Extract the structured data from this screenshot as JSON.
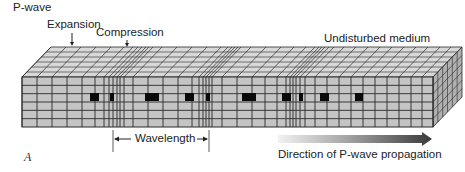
{
  "figure": {
    "title": "P-wave",
    "panel_label": "A",
    "labels": {
      "expansion": "Expansion",
      "compression": "Compression",
      "undisturbed": "Undisturbed medium",
      "wavelength": "Wavelength",
      "direction": "Direction of P-wave propagation"
    },
    "colors": {
      "block_face": "#c4c4c4",
      "top_face": "#d8d8d8",
      "side_face": "#b0b0b0",
      "grid_line": "#2a2a2a",
      "particle": "#0a0a0a",
      "arrow_start": "#f2f2f2",
      "arrow_end": "#3a3a3a",
      "text": "#222222"
    },
    "block": {
      "front": {
        "x0": 22,
        "y0": 77,
        "x1": 433,
        "y1": 127
      },
      "depth_dx": 29,
      "depth_dy": -30,
      "rows": 6,
      "depth_rows": 6
    },
    "vertical_lines_x": [
      22,
      37,
      52,
      67,
      82,
      95,
      104,
      109,
      113,
      117,
      120,
      124,
      133,
      148,
      163,
      178,
      192,
      199,
      203,
      206,
      209,
      212,
      222,
      237,
      252,
      265,
      277,
      286,
      290,
      293,
      296,
      300,
      305,
      315,
      327,
      339,
      351,
      363,
      375,
      387,
      399,
      411,
      422,
      433
    ],
    "particles": [
      {
        "x": 90,
        "w": 9
      },
      {
        "x": 110,
        "w": 4
      },
      {
        "x": 145,
        "w": 14
      },
      {
        "x": 185,
        "w": 9
      },
      {
        "x": 206,
        "w": 4
      },
      {
        "x": 242,
        "w": 14
      },
      {
        "x": 282,
        "w": 9
      },
      {
        "x": 299,
        "w": 4
      },
      {
        "x": 320,
        "w": 9
      },
      {
        "x": 355,
        "w": 8
      }
    ],
    "particle_row": {
      "y": 93,
      "h": 8
    },
    "wavelength_bracket": {
      "x0": 113,
      "x1": 209,
      "y0": 130,
      "y1": 152,
      "arrow_y": 139
    },
    "propagation_arrow": {
      "x0": 278,
      "x1": 432,
      "y": 139,
      "thickness": 8
    }
  }
}
